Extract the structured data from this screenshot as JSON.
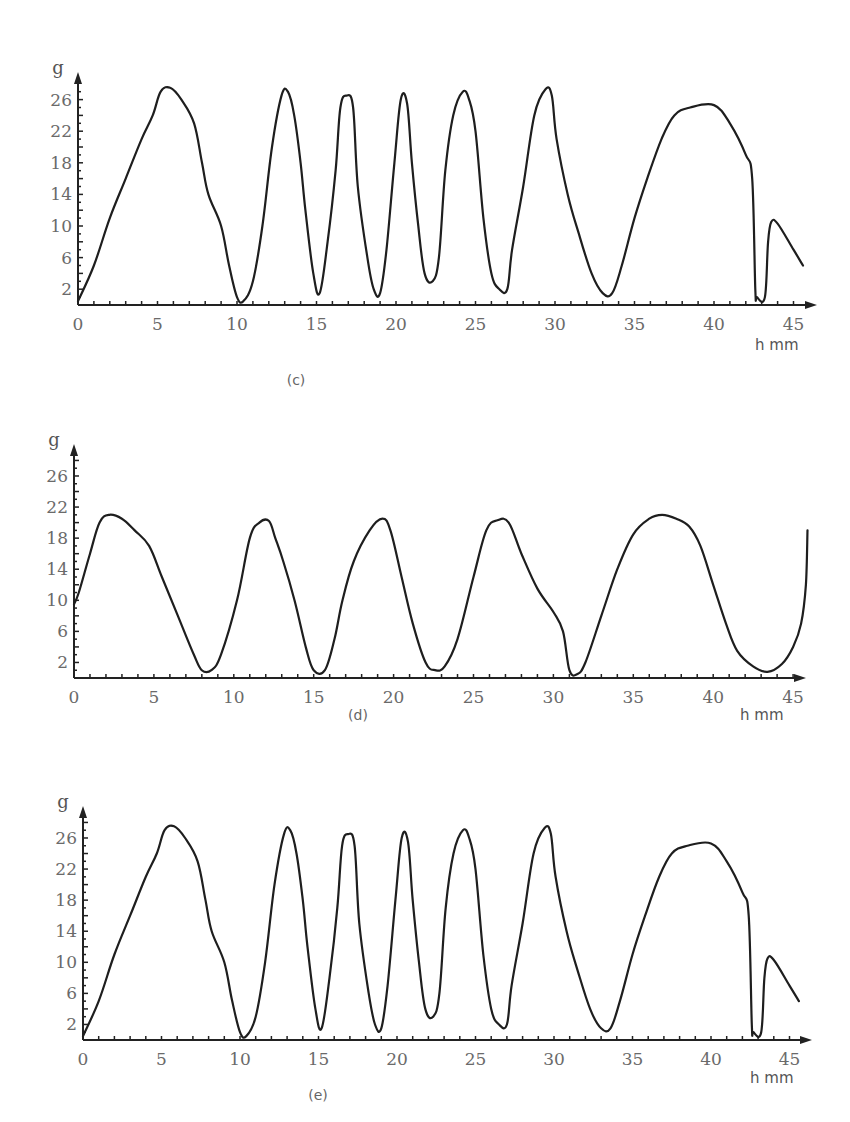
{
  "chart_data": [
    {
      "type": "line",
      "panel": "(c)",
      "ylabel": "g",
      "xlabel": "h mm",
      "xticks": [
        0,
        5,
        10,
        15,
        20,
        25,
        30,
        35,
        40,
        45
      ],
      "yticks": [
        2,
        6,
        10,
        14,
        18,
        22,
        26
      ],
      "xlim": [
        0,
        46.5
      ],
      "ylim": [
        0,
        29.5
      ],
      "grid": false,
      "series": [
        {
          "name": "g vs h",
          "points": [
            [
              0,
              0.5
            ],
            [
              1,
              5
            ],
            [
              2,
              11
            ],
            [
              3,
              16
            ],
            [
              4,
              21
            ],
            [
              4.7,
              24
            ],
            [
              5.2,
              27
            ],
            [
              5.8,
              27.5
            ],
            [
              6.5,
              26
            ],
            [
              7.3,
              23
            ],
            [
              7.8,
              18
            ],
            [
              8.2,
              14
            ],
            [
              9,
              10
            ],
            [
              9.5,
              5
            ],
            [
              10,
              1
            ],
            [
              10.4,
              0.5
            ],
            [
              11,
              3
            ],
            [
              11.6,
              10
            ],
            [
              12.2,
              20
            ],
            [
              12.8,
              26.5
            ],
            [
              13.2,
              27
            ],
            [
              13.6,
              24
            ],
            [
              14,
              18
            ],
            [
              14.3,
              12
            ],
            [
              14.8,
              4
            ],
            [
              15.2,
              1.5
            ],
            [
              15.7,
              8
            ],
            [
              16.2,
              17
            ],
            [
              16.5,
              25
            ],
            [
              16.9,
              26.5
            ],
            [
              17.3,
              25
            ],
            [
              17.6,
              15
            ],
            [
              18.2,
              6
            ],
            [
              18.6,
              2
            ],
            [
              19,
              1.5
            ],
            [
              19.4,
              7
            ],
            [
              19.9,
              18
            ],
            [
              20.3,
              26
            ],
            [
              20.7,
              25.5
            ],
            [
              21,
              18
            ],
            [
              21.4,
              10
            ],
            [
              21.8,
              4
            ],
            [
              22.3,
              3
            ],
            [
              22.7,
              6
            ],
            [
              23.1,
              17
            ],
            [
              23.6,
              24
            ],
            [
              24.2,
              27
            ],
            [
              24.6,
              26
            ],
            [
              25,
              22
            ],
            [
              25.5,
              11
            ],
            [
              26,
              4
            ],
            [
              26.5,
              2
            ],
            [
              27,
              2
            ],
            [
              27.3,
              7
            ],
            [
              28,
              15
            ],
            [
              28.7,
              24
            ],
            [
              29.4,
              27.3
            ],
            [
              29.8,
              26.5
            ],
            [
              30.1,
              21
            ],
            [
              30.8,
              14
            ],
            [
              31.5,
              9
            ],
            [
              32.3,
              4
            ],
            [
              33,
              1.5
            ],
            [
              33.6,
              1.5
            ],
            [
              34.2,
              5
            ],
            [
              35,
              11
            ],
            [
              35.8,
              16
            ],
            [
              36.7,
              21
            ],
            [
              37.5,
              24
            ],
            [
              38.5,
              25
            ],
            [
              40,
              25.3
            ],
            [
              41,
              23
            ],
            [
              42,
              19
            ],
            [
              42.4,
              16
            ],
            [
              42.6,
              2
            ],
            [
              42.7,
              1
            ],
            [
              43.2,
              1
            ],
            [
              43.4,
              8
            ],
            [
              43.6,
              10.5
            ],
            [
              44,
              10.3
            ],
            [
              45,
              7
            ],
            [
              45.6,
              5
            ]
          ]
        }
      ]
    },
    {
      "type": "line",
      "panel": "(d)",
      "ylabel": "g",
      "xlabel": "h mm",
      "xticks": [
        0,
        5,
        10,
        15,
        20,
        25,
        30,
        35,
        40,
        45
      ],
      "yticks": [
        2,
        6,
        10,
        14,
        18,
        22,
        26
      ],
      "xlim": [
        0,
        46.5
      ],
      "ylim": [
        0,
        29.5
      ],
      "grid": false,
      "series": [
        {
          "name": "g vs h",
          "points": [
            [
              0,
              9.5
            ],
            [
              0.3,
              11
            ],
            [
              1,
              16
            ],
            [
              1.6,
              20
            ],
            [
              2.2,
              21
            ],
            [
              3,
              20.5
            ],
            [
              3.8,
              19
            ],
            [
              4.7,
              17
            ],
            [
              5.5,
              13
            ],
            [
              6.5,
              8
            ],
            [
              7.5,
              3
            ],
            [
              8,
              1
            ],
            [
              8.6,
              1
            ],
            [
              9.2,
              3
            ],
            [
              10.2,
              10
            ],
            [
              11,
              18
            ],
            [
              11.6,
              20
            ],
            [
              12.2,
              20.2
            ],
            [
              12.6,
              18
            ],
            [
              13.1,
              15
            ],
            [
              13.8,
              10
            ],
            [
              14.5,
              4
            ],
            [
              15,
              1
            ],
            [
              15.7,
              1
            ],
            [
              16.3,
              5
            ],
            [
              16.8,
              10
            ],
            [
              17.5,
              15
            ],
            [
              18.5,
              19
            ],
            [
              19.3,
              20.5
            ],
            [
              19.8,
              19
            ],
            [
              20.5,
              13
            ],
            [
              21.2,
              7
            ],
            [
              22,
              2
            ],
            [
              22.6,
              1
            ],
            [
              23.2,
              1.5
            ],
            [
              24,
              5
            ],
            [
              25,
              13
            ],
            [
              25.8,
              19
            ],
            [
              26.5,
              20.3
            ],
            [
              27.2,
              20
            ],
            [
              28,
              16
            ],
            [
              29,
              11.5
            ],
            [
              30,
              8.5
            ],
            [
              30.6,
              6
            ],
            [
              31,
              1
            ],
            [
              31.5,
              0.5
            ],
            [
              32,
              2
            ],
            [
              33,
              8
            ],
            [
              34,
              14
            ],
            [
              35,
              18.5
            ],
            [
              36,
              20.5
            ],
            [
              36.8,
              21
            ],
            [
              37.7,
              20.5
            ],
            [
              38.5,
              19.5
            ],
            [
              39.2,
              17
            ],
            [
              40,
              12
            ],
            [
              40.8,
              7
            ],
            [
              41.5,
              3.5
            ],
            [
              42.5,
              1.5
            ],
            [
              43.4,
              0.8
            ],
            [
              44.3,
              1.8
            ],
            [
              45,
              4
            ],
            [
              45.5,
              7
            ],
            [
              45.8,
              12
            ],
            [
              45.9,
              19
            ]
          ]
        }
      ]
    },
    {
      "type": "line",
      "panel": "(e)",
      "ylabel": "g",
      "xlabel": "h mm",
      "xticks": [
        0,
        5,
        10,
        15,
        20,
        25,
        30,
        35,
        40,
        45
      ],
      "yticks": [
        2,
        6,
        10,
        14,
        18,
        22,
        26
      ],
      "xlim": [
        0,
        46.5
      ],
      "ylim": [
        0,
        29.5
      ],
      "grid": false,
      "series": [
        {
          "name": "g vs h",
          "points": [
            [
              0,
              0.5
            ],
            [
              1,
              5
            ],
            [
              2,
              11
            ],
            [
              3,
              16
            ],
            [
              4,
              21
            ],
            [
              4.7,
              24
            ],
            [
              5.2,
              27
            ],
            [
              5.8,
              27.5
            ],
            [
              6.5,
              26
            ],
            [
              7.3,
              23
            ],
            [
              7.8,
              18
            ],
            [
              8.2,
              14
            ],
            [
              9,
              10
            ],
            [
              9.5,
              5
            ],
            [
              10,
              1
            ],
            [
              10.4,
              0.5
            ],
            [
              11,
              3
            ],
            [
              11.6,
              10
            ],
            [
              12.2,
              20
            ],
            [
              12.8,
              26.5
            ],
            [
              13.2,
              27
            ],
            [
              13.6,
              24
            ],
            [
              14,
              18
            ],
            [
              14.3,
              12
            ],
            [
              14.8,
              4
            ],
            [
              15.2,
              1.5
            ],
            [
              15.7,
              8
            ],
            [
              16.2,
              17
            ],
            [
              16.5,
              25
            ],
            [
              16.9,
              26.5
            ],
            [
              17.3,
              25
            ],
            [
              17.6,
              15
            ],
            [
              18.2,
              6
            ],
            [
              18.6,
              2
            ],
            [
              19,
              1.5
            ],
            [
              19.4,
              7
            ],
            [
              19.9,
              18
            ],
            [
              20.3,
              26
            ],
            [
              20.7,
              25.5
            ],
            [
              21,
              18
            ],
            [
              21.4,
              10
            ],
            [
              21.8,
              4
            ],
            [
              22.3,
              3
            ],
            [
              22.7,
              6
            ],
            [
              23.1,
              17
            ],
            [
              23.6,
              24
            ],
            [
              24.2,
              27
            ],
            [
              24.6,
              26
            ],
            [
              25,
              22
            ],
            [
              25.5,
              11
            ],
            [
              26,
              4
            ],
            [
              26.5,
              2
            ],
            [
              27,
              2
            ],
            [
              27.3,
              7
            ],
            [
              28,
              15
            ],
            [
              28.7,
              24
            ],
            [
              29.4,
              27.3
            ],
            [
              29.8,
              26.5
            ],
            [
              30.1,
              21
            ],
            [
              30.8,
              14
            ],
            [
              31.5,
              9
            ],
            [
              32.3,
              4
            ],
            [
              33,
              1.5
            ],
            [
              33.6,
              1.5
            ],
            [
              34.2,
              5
            ],
            [
              35,
              11
            ],
            [
              35.8,
              16
            ],
            [
              36.7,
              21
            ],
            [
              37.5,
              24
            ],
            [
              38.5,
              25
            ],
            [
              40,
              25.3
            ],
            [
              41,
              23
            ],
            [
              42,
              19
            ],
            [
              42.4,
              16
            ],
            [
              42.6,
              2
            ],
            [
              42.7,
              1
            ],
            [
              43.2,
              1
            ],
            [
              43.4,
              8
            ],
            [
              43.6,
              10.5
            ],
            [
              44,
              10.3
            ],
            [
              45,
              7
            ],
            [
              45.6,
              5
            ]
          ]
        }
      ]
    }
  ]
}
